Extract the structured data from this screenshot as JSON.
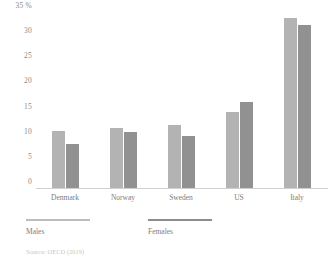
{
  "chart_data": {
    "type": "bar",
    "title": "",
    "xlabel": "",
    "ylabel": "35 %",
    "categories": [
      "Denmark",
      "Norway",
      "Sweden",
      "US",
      "Italy"
    ],
    "series": [
      {
        "name": "Males",
        "color": "#b3b3b3",
        "values": [
          11.3,
          11.9,
          12.6,
          15.1,
          33.8
        ]
      },
      {
        "name": "Females",
        "color": "#919191",
        "values": [
          8.7,
          11.2,
          10.4,
          17.1,
          32.4
        ]
      }
    ],
    "ylim": [
      0,
      35
    ],
    "yticks": [
      "35 %",
      "30",
      "25",
      "20",
      "15",
      "10",
      "5",
      "0"
    ],
    "ytick_values": [
      35,
      30,
      25,
      20,
      15,
      10,
      5,
      0
    ],
    "grid": false,
    "legend_position": "bottom-left"
  },
  "legend": {
    "males": "Males",
    "females": "Females"
  },
  "source": {
    "note": "Source: OECD (2019)"
  }
}
